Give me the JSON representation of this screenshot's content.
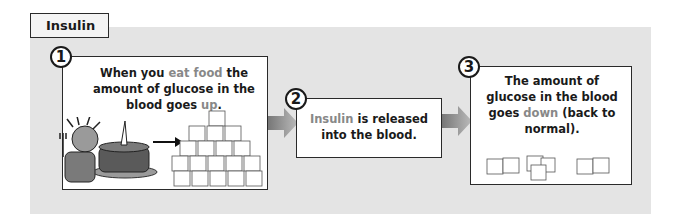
{
  "title": "Insulin",
  "colors": {
    "panel": "#e4e4e4",
    "highlight": "#888888",
    "border": "#2a2a2a"
  },
  "steps": [
    {
      "number": "1",
      "parts": [
        "When you ",
        "eat food",
        " the amount of glucose in the blood goes ",
        "up",
        "."
      ],
      "illustration": "person eating cake, arrow to large pile of sugar cubes"
    },
    {
      "number": "2",
      "parts": [
        "Insulin",
        " is released into the blood."
      ]
    },
    {
      "number": "3",
      "parts": [
        "The amount of glucose in the blood goes ",
        "down",
        " (back to normal)."
      ],
      "illustration": "few sugar cubes"
    }
  ],
  "icons": {
    "arrow1": "arrow-right-icon",
    "arrow2": "arrow-right-icon"
  }
}
